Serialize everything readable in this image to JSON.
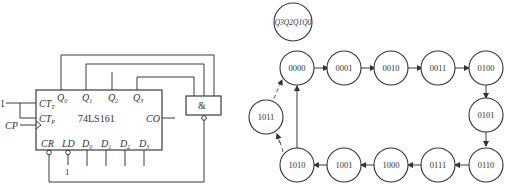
{
  "circuit": {
    "chip_label": "74LS161",
    "pins_top": [
      "Q0",
      "Q1",
      "Q2",
      "Q3"
    ],
    "pins_left": {
      "ct_t": "CT",
      "ct_t_sub": "T",
      "ct_p": "CT",
      "ct_p_sub": "P"
    },
    "clock_label": "CP",
    "carry_out": "CO",
    "pins_bottom": {
      "cr": "CR",
      "ld": "LD",
      "d0": "D",
      "d0_sub": "0",
      "d1": "D",
      "d1_sub": "1",
      "d2": "D",
      "d2_sub": "2",
      "d3": "D",
      "d3_sub": "3"
    },
    "q_labels": {
      "q0": "Q",
      "q0_sub": "0",
      "q1": "Q",
      "q1_sub": "1",
      "q2": "Q",
      "q2_sub": "2",
      "q3": "Q",
      "q3_sub": "3"
    },
    "enable_input": "1",
    "ld_input": "1",
    "gate_symbol": "&"
  },
  "state_diagram": {
    "legend": "Q3Q2Q1Q0",
    "states": [
      "0000",
      "0001",
      "0010",
      "0011",
      "0100",
      "0101",
      "0110",
      "0111",
      "1000",
      "1001",
      "1010",
      "1011"
    ],
    "transitions": [
      [
        "0000",
        "0001"
      ],
      [
        "0001",
        "0010"
      ],
      [
        "0010",
        "0011"
      ],
      [
        "0011",
        "0100"
      ],
      [
        "0100",
        "0101"
      ],
      [
        "0101",
        "0110"
      ],
      [
        "0110",
        "0111"
      ],
      [
        "0111",
        "1000"
      ],
      [
        "1000",
        "1001"
      ],
      [
        "1001",
        "1010"
      ],
      [
        "1010",
        "0000"
      ]
    ],
    "dashed_transitions": [
      [
        "1010",
        "1011"
      ],
      [
        "1011",
        "0000"
      ]
    ]
  }
}
